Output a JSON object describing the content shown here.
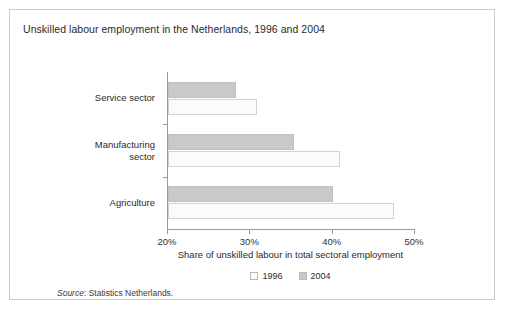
{
  "figure": {
    "title": "Unskilled labour employment in the Netherlands, 1996 and 2004",
    "source_word": "Source",
    "source_text": ": Statistics Netherlands."
  },
  "chart_data": {
    "type": "bar",
    "orientation": "horizontal",
    "title": "Unskilled labour employment in the Netherlands, 1996 and 2004",
    "xlabel": "Share of unskilled labour in total sectoral employment",
    "ylabel": "",
    "xlim": [
      20,
      50
    ],
    "xticks": [
      20,
      30,
      40,
      50
    ],
    "xtick_labels": [
      "20%",
      "30%",
      "40%",
      "50%"
    ],
    "grid": false,
    "legend_position": "bottom",
    "categories": [
      "Service sector",
      "Manufacturing sector",
      "Agriculture"
    ],
    "series": [
      {
        "name": "1996",
        "color": "#fbfbfb",
        "values": [
          30.8,
          40.9,
          47.5
        ]
      },
      {
        "name": "2004",
        "color": "#c9c9c9",
        "values": [
          28.3,
          35.3,
          40.0
        ]
      }
    ]
  }
}
